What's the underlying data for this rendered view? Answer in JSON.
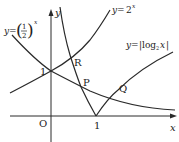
{
  "diagram": {
    "axes": {
      "x_label": "x",
      "y_label": "y",
      "origin_label": "O",
      "x_tick": "1",
      "y_tick": "1"
    },
    "curves": [
      {
        "id": "exp2",
        "label_lhs": "y=",
        "label_base": "2",
        "label_exp": "x"
      },
      {
        "id": "exp_half",
        "label_lhs": "y=",
        "label_num": "1",
        "label_den": "2",
        "label_exp": "x"
      },
      {
        "id": "abs_log",
        "label": "y=|log",
        "label_sub": "2",
        "label_tail": "x|"
      }
    ],
    "points": {
      "R": "R",
      "P": "P",
      "Q": "Q"
    },
    "colors": {
      "stroke": "#2a2a2a",
      "text": "#222222"
    }
  }
}
